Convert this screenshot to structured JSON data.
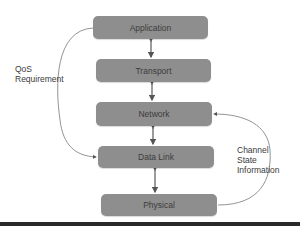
{
  "diagram": {
    "layers": [
      {
        "label": "Application"
      },
      {
        "label": "Transport"
      },
      {
        "label": "Network"
      },
      {
        "label": "Data Link"
      },
      {
        "label": "Physical"
      }
    ],
    "annotations": {
      "qos": [
        "QoS",
        "Requirement"
      ],
      "csi": [
        "Channel",
        "State",
        "Information"
      ]
    },
    "connections": [
      {
        "from": "Application",
        "to": "Transport",
        "type": "bidirectional"
      },
      {
        "from": "Transport",
        "to": "Network",
        "type": "bidirectional"
      },
      {
        "from": "Network",
        "to": "Data Link",
        "type": "bidirectional"
      },
      {
        "from": "Data Link",
        "to": "Physical",
        "type": "bidirectional"
      },
      {
        "from": "Application",
        "to": "Data Link",
        "label": "QoS Requirement",
        "type": "curved"
      },
      {
        "from": "Physical",
        "to": "Network",
        "label": "Channel State Information",
        "type": "curved"
      }
    ],
    "colors": {
      "box": "#8e8e8e",
      "text": "#3c3c3c",
      "line": "#666666"
    }
  }
}
